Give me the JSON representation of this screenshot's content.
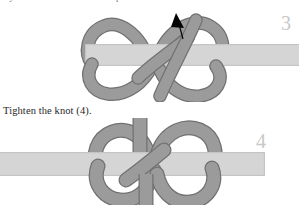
{
  "page": {
    "background_color": "#ffffff",
    "top_cut_text": "ary take the free bottom end up",
    "caption": "Tighten the knot (4).",
    "width": 299,
    "height": 205
  },
  "colors": {
    "band": "#d5d5d5",
    "band_edge": "#bfbfbf",
    "rope": "#9a9a9a",
    "rope_outline": "#6f6f6f",
    "arrow": "#000000",
    "numeral": "#c8c8c8",
    "text": "#1d1d1d"
  },
  "figures": [
    {
      "id": "figure-3",
      "step_number": "3",
      "description": "Loose figure-eight knot formed around a flat band, with a black arrow indicating the direction to pull the working end upward.",
      "has_arrow": true,
      "band_label": "horizontal-flat-band",
      "rope_label": "knot-rope"
    },
    {
      "id": "figure-4",
      "step_number": "4",
      "description": "The same knot tightened down onto the flat band, loops drawn snug.",
      "has_arrow": false,
      "band_label": "horizontal-flat-band",
      "rope_label": "knot-rope"
    }
  ]
}
